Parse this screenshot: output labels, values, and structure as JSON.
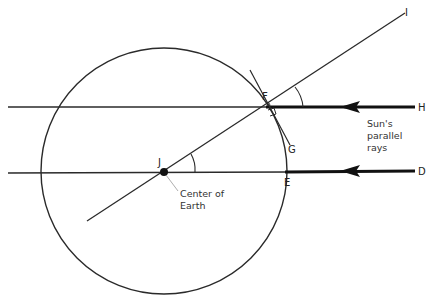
{
  "diagram": {
    "labels": {
      "F": "F",
      "G": "G",
      "H": "H",
      "D": "D",
      "E": "E",
      "I": "I",
      "J": "J"
    },
    "annotations": {
      "center_line1": "Center of",
      "center_line2": "Earth",
      "sun_line1": "Sun's",
      "sun_line2": "parallel",
      "sun_line3": "rays"
    },
    "colors": {
      "line": "#2a2a2a",
      "ray": "#111111",
      "text": "#222222"
    }
  }
}
